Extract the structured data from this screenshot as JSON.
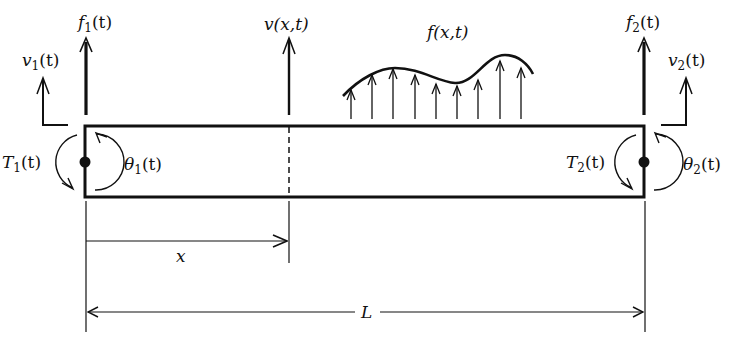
{
  "diagram": {
    "type": "beam-free-body",
    "colors": {
      "ink": "#111111",
      "background": "#ffffff"
    },
    "beam": {
      "left_x": 85,
      "right_x": 644,
      "top_y": 126,
      "bottom_y": 197
    },
    "labels": {
      "f1": {
        "base": "f",
        "sub": "1",
        "arg": "(t)"
      },
      "f2": {
        "base": "f",
        "sub": "2",
        "arg": "(t)"
      },
      "v1": {
        "base": "v",
        "sub": "1",
        "arg": "(t)"
      },
      "v2": {
        "base": "v",
        "sub": "2",
        "arg": "(t)"
      },
      "T1": {
        "base": "T",
        "sub": "1",
        "arg": "(t)"
      },
      "T2": {
        "base": "T",
        "sub": "2",
        "arg": "(t)"
      },
      "theta1": {
        "base": "θ",
        "sub": "1",
        "arg": "(t)"
      },
      "theta2": {
        "base": "θ",
        "sub": "2",
        "arg": "(t)"
      },
      "vxt": "v(x,t)",
      "fxt": "f(x,t)",
      "x": "x",
      "L": "L"
    },
    "distributed_load": {
      "arrow_x": [
        351,
        372,
        393,
        415,
        436,
        457,
        478,
        500,
        521
      ],
      "arrow_top_y": [
        90,
        75,
        69,
        75,
        84,
        86,
        80,
        61,
        68
      ],
      "base_y": 119
    }
  }
}
